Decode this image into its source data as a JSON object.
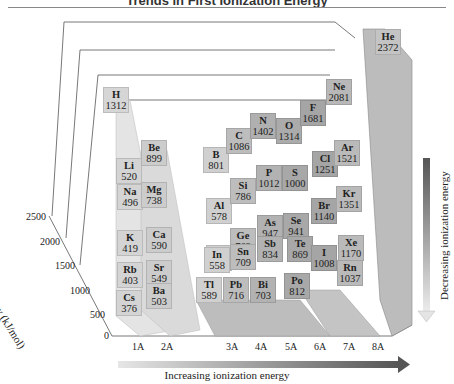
{
  "title": "Trends in First Ionization Energy",
  "chart_data": {
    "type": "bar",
    "subtype": "3d-bar",
    "title": "Trends in First Ionization Energy",
    "ylabel": "Ionization energy (kJ/mol)",
    "xlabel": "",
    "ylim": [
      0,
      2500
    ],
    "yticks": [
      0,
      500,
      1000,
      1500,
      2000,
      2500
    ],
    "categories": [
      "1A",
      "2A",
      "3A",
      "4A",
      "5A",
      "6A",
      "7A",
      "8A"
    ],
    "grid": true,
    "annotations": [
      "Increasing ionization energy",
      "Decreasing ionization energy"
    ],
    "elements": [
      {
        "symbol": "H",
        "group": "1A",
        "period": 1,
        "value": 1312
      },
      {
        "symbol": "He",
        "group": "8A",
        "period": 1,
        "value": 2372
      },
      {
        "symbol": "Li",
        "group": "1A",
        "period": 2,
        "value": 520
      },
      {
        "symbol": "Be",
        "group": "2A",
        "period": 2,
        "value": 899
      },
      {
        "symbol": "B",
        "group": "3A",
        "period": 2,
        "value": 801
      },
      {
        "symbol": "C",
        "group": "4A",
        "period": 2,
        "value": 1086
      },
      {
        "symbol": "N",
        "group": "5A",
        "period": 2,
        "value": 1402
      },
      {
        "symbol": "O",
        "group": "6A",
        "period": 2,
        "value": 1314
      },
      {
        "symbol": "F",
        "group": "7A",
        "period": 2,
        "value": 1681
      },
      {
        "symbol": "Ne",
        "group": "8A",
        "period": 2,
        "value": 2081
      },
      {
        "symbol": "Na",
        "group": "1A",
        "period": 3,
        "value": 496
      },
      {
        "symbol": "Mg",
        "group": "2A",
        "period": 3,
        "value": 738
      },
      {
        "symbol": "Al",
        "group": "3A",
        "period": 3,
        "value": 578
      },
      {
        "symbol": "Si",
        "group": "4A",
        "period": 3,
        "value": 786
      },
      {
        "symbol": "P",
        "group": "5A",
        "period": 3,
        "value": 1012
      },
      {
        "symbol": "S",
        "group": "6A",
        "period": 3,
        "value": 1000
      },
      {
        "symbol": "Cl",
        "group": "7A",
        "period": 3,
        "value": 1251
      },
      {
        "symbol": "Ar",
        "group": "8A",
        "period": 3,
        "value": 1521
      },
      {
        "symbol": "K",
        "group": "1A",
        "period": 4,
        "value": 419
      },
      {
        "symbol": "Ca",
        "group": "2A",
        "period": 4,
        "value": 590
      },
      {
        "symbol": "Ga",
        "group": "3A",
        "period": 4,
        "value": 579
      },
      {
        "symbol": "Ge",
        "group": "4A",
        "period": 4,
        "value": 762
      },
      {
        "symbol": "As",
        "group": "5A",
        "period": 4,
        "value": 947
      },
      {
        "symbol": "Se",
        "group": "6A",
        "period": 4,
        "value": 941
      },
      {
        "symbol": "Br",
        "group": "7A",
        "period": 4,
        "value": 1140
      },
      {
        "symbol": "Kr",
        "group": "8A",
        "period": 4,
        "value": 1351
      },
      {
        "symbol": "Rb",
        "group": "1A",
        "period": 5,
        "value": 403
      },
      {
        "symbol": "Sr",
        "group": "2A",
        "period": 5,
        "value": 549
      },
      {
        "symbol": "In",
        "group": "3A",
        "period": 5,
        "value": 558
      },
      {
        "symbol": "Sn",
        "group": "4A",
        "period": 5,
        "value": 709
      },
      {
        "symbol": "Sb",
        "group": "5A",
        "period": 5,
        "value": 834
      },
      {
        "symbol": "Te",
        "group": "6A",
        "period": 5,
        "value": 869
      },
      {
        "symbol": "I",
        "group": "7A",
        "period": 5,
        "value": 1008
      },
      {
        "symbol": "Xe",
        "group": "8A",
        "period": 5,
        "value": 1170
      },
      {
        "symbol": "Cs",
        "group": "1A",
        "period": 6,
        "value": 376
      },
      {
        "symbol": "Ba",
        "group": "2A",
        "period": 6,
        "value": 503
      },
      {
        "symbol": "Tl",
        "group": "3A",
        "period": 6,
        "value": 589
      },
      {
        "symbol": "Pb",
        "group": "4A",
        "period": 6,
        "value": 716
      },
      {
        "symbol": "Bi",
        "group": "5A",
        "period": 6,
        "value": 703
      },
      {
        "symbol": "Po",
        "group": "6A",
        "period": 6,
        "value": 812
      },
      {
        "symbol": "Rn",
        "group": "8A",
        "period": 6,
        "value": 1037
      }
    ]
  },
  "axis": {
    "ylabel": "Ionization energy (kJ/mol)",
    "yticks": [
      "0",
      "500",
      "1000",
      "1500",
      "2000",
      "2500"
    ],
    "xticks": [
      "1A",
      "2A",
      "3A",
      "4A",
      "5A",
      "6A",
      "7A",
      "8A"
    ]
  },
  "arrows": {
    "horizontal": "Increasing ionization energy",
    "vertical": "Decreasing ionization energy"
  },
  "cells": [
    {
      "sym": "H",
      "val": "1312",
      "x": 103,
      "y": 87,
      "c": "#d6d6d6"
    },
    {
      "sym": "He",
      "val": "2372",
      "x": 375,
      "y": 29,
      "c": "#c4c4c4"
    },
    {
      "sym": "Li",
      "val": "520",
      "x": 116,
      "y": 158,
      "c": "#d4d4d4"
    },
    {
      "sym": "Be",
      "val": "899",
      "x": 141,
      "y": 140,
      "c": "#cccccc"
    },
    {
      "sym": "B",
      "val": "801",
      "x": 203,
      "y": 147,
      "c": "#d0d0d0"
    },
    {
      "sym": "C",
      "val": "1086",
      "x": 226,
      "y": 128,
      "c": "#bdbdbd"
    },
    {
      "sym": "N",
      "val": "1402",
      "x": 250,
      "y": 113,
      "c": "#b0b0b0"
    },
    {
      "sym": "O",
      "val": "1314",
      "x": 276,
      "y": 118,
      "c": "#ababab"
    },
    {
      "sym": "F",
      "val": "1681",
      "x": 300,
      "y": 100,
      "c": "#a5a5a5"
    },
    {
      "sym": "Ne",
      "val": "2081",
      "x": 326,
      "y": 79,
      "c": "#b8b8b8"
    },
    {
      "sym": "Na",
      "val": "496",
      "x": 117,
      "y": 184,
      "c": "#d4d4d4"
    },
    {
      "sym": "Mg",
      "val": "738",
      "x": 141,
      "y": 182,
      "c": "#cccccc"
    },
    {
      "sym": "Al",
      "val": "578",
      "x": 206,
      "y": 198,
      "c": "#d0d0d0"
    },
    {
      "sym": "Si",
      "val": "786",
      "x": 230,
      "y": 178,
      "c": "#bdbdbd"
    },
    {
      "sym": "P",
      "val": "1012",
      "x": 256,
      "y": 165,
      "c": "#b2b2b2"
    },
    {
      "sym": "S",
      "val": "1000",
      "x": 282,
      "y": 165,
      "c": "#a8a8a8"
    },
    {
      "sym": "Cl",
      "val": "1251",
      "x": 312,
      "y": 151,
      "c": "#a5a5a5"
    },
    {
      "sym": "Ar",
      "val": "1521",
      "x": 334,
      "y": 140,
      "c": "#bababa"
    },
    {
      "sym": "K",
      "val": "419",
      "x": 117,
      "y": 230,
      "c": "#d4d4d4"
    },
    {
      "sym": "Ca",
      "val": "590",
      "x": 146,
      "y": 227,
      "c": "#cccccc"
    },
    {
      "sym": "Ga",
      "val": "579",
      "x": 206,
      "y": 245,
      "c": "#d0d0d0"
    },
    {
      "sym": "Ge",
      "val": "762",
      "x": 230,
      "y": 228,
      "c": "#bdbdbd"
    },
    {
      "sym": "As",
      "val": "947",
      "x": 257,
      "y": 215,
      "c": "#b2b2b2"
    },
    {
      "sym": "Se",
      "val": "941",
      "x": 283,
      "y": 213,
      "c": "#a8a8a8"
    },
    {
      "sym": "Br",
      "val": "1140",
      "x": 311,
      "y": 198,
      "c": "#a5a5a5"
    },
    {
      "sym": "Kr",
      "val": "1351",
      "x": 336,
      "y": 186,
      "c": "#bababa"
    },
    {
      "sym": "Rb",
      "val": "403",
      "x": 117,
      "y": 262,
      "c": "#d4d4d4"
    },
    {
      "sym": "Sr",
      "val": "549",
      "x": 146,
      "y": 260,
      "c": "#cccccc"
    },
    {
      "sym": "In",
      "val": "558",
      "x": 204,
      "y": 247,
      "c": "#d0d0d0"
    },
    {
      "sym": "Sn",
      "val": "709",
      "x": 230,
      "y": 244,
      "c": "#bdbdbd"
    },
    {
      "sym": "Sb",
      "val": "834",
      "x": 257,
      "y": 236,
      "c": "#b2b2b2"
    },
    {
      "sym": "Te",
      "val": "869",
      "x": 287,
      "y": 236,
      "c": "#a8a8a8"
    },
    {
      "sym": "I",
      "val": "1008",
      "x": 311,
      "y": 245,
      "c": "#a5a5a5"
    },
    {
      "sym": "Xe",
      "val": "1170",
      "x": 338,
      "y": 235,
      "c": "#bababa"
    },
    {
      "sym": "Cs",
      "val": "376",
      "x": 116,
      "y": 290,
      "c": "#d4d4d4"
    },
    {
      "sym": "Ba",
      "val": "503",
      "x": 146,
      "y": 283,
      "c": "#cccccc"
    },
    {
      "sym": "Tl",
      "val": "589",
      "x": 196,
      "y": 277,
      "c": "#d0d0d0"
    },
    {
      "sym": "Pb",
      "val": "716",
      "x": 223,
      "y": 277,
      "c": "#bdbdbd"
    },
    {
      "sym": "Bi",
      "val": "703",
      "x": 250,
      "y": 277,
      "c": "#b2b2b2"
    },
    {
      "sym": "Po",
      "val": "812",
      "x": 284,
      "y": 273,
      "c": "#a8a8a8"
    },
    {
      "sym": "Rn",
      "val": "1037",
      "x": 337,
      "y": 260,
      "c": "#bababa"
    }
  ]
}
